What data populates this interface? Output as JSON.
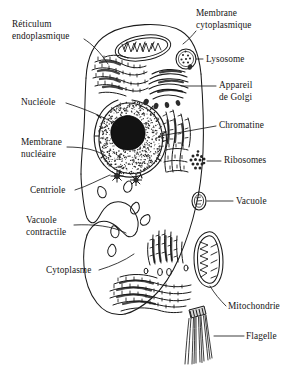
{
  "figure": {
    "language": "fr",
    "style": "black and white line drawing, hand-drawn biology textbook schematic",
    "background_color": "#ffffff",
    "ink_color": "#1a1a1a",
    "width": 301,
    "height": 377
  },
  "labels": {
    "reticulum_endoplasmique": "Réticulum\nendoplasmique",
    "reticulum_line1": "Réticulum",
    "reticulum_line2": "endoplasmique",
    "membrane_cytoplasmique_line1": "Membrane",
    "membrane_cytoplasmique_line2": "cytoplasmique",
    "lysosome": "Lysosome",
    "appareil_de_golgi_line1": "Appareil",
    "appareil_de_golgi_line2": "de Golgi",
    "nucleole": "Nucléole",
    "chromatine": "Chromatine",
    "membrane_nucleaire_line1": "Membrane",
    "membrane_nucleaire_line2": "nucléaire",
    "ribosomes": "Ribosomes",
    "centriole": "Centriole",
    "vacuole": "Vacuole",
    "vacuole_contractile_line1": "Vacuole",
    "vacuole_contractile_line2": "contractile",
    "cytoplasme": "Cytoplasme",
    "mitochondrie": "Mitochondrie",
    "flagelle": "Flagelle"
  },
  "structures": [
    {
      "name": "reticulum-endoplasmique",
      "label": "Réticulum endoplasmique",
      "side": "left",
      "label_xy": [
        12,
        24
      ]
    },
    {
      "name": "membrane-cytoplasmique",
      "label": "Membrane cytoplasmique",
      "side": "right",
      "label_xy": [
        196,
        10
      ]
    },
    {
      "name": "lysosome",
      "label": "Lysosome",
      "side": "right",
      "label_xy": [
        205,
        58
      ]
    },
    {
      "name": "appareil-de-golgi",
      "label": "Appareil de Golgi",
      "side": "right",
      "label_xy": [
        219,
        84
      ]
    },
    {
      "name": "nucleole",
      "label": "Nucléole",
      "side": "left",
      "label_xy": [
        22,
        98
      ]
    },
    {
      "name": "chromatine",
      "label": "Chromatine",
      "side": "right",
      "label_xy": [
        219,
        124
      ]
    },
    {
      "name": "membrane-nucleaire",
      "label": "Membrane nucléaire",
      "side": "left",
      "label_xy": [
        22,
        142
      ]
    },
    {
      "name": "ribosomes",
      "label": "Ribosomes",
      "side": "right",
      "label_xy": [
        224,
        156
      ]
    },
    {
      "name": "centriole",
      "label": "Centriole",
      "side": "left",
      "label_xy": [
        30,
        189
      ]
    },
    {
      "name": "vacuole",
      "label": "Vacuole",
      "side": "right",
      "label_xy": [
        236,
        200
      ]
    },
    {
      "name": "vacuole-contractile",
      "label": "Vacuole contractile",
      "side": "left",
      "label_xy": [
        26,
        220
      ]
    },
    {
      "name": "cytoplasme",
      "label": "Cytoplasme",
      "side": "left",
      "label_xy": [
        46,
        268
      ]
    },
    {
      "name": "mitochondrie",
      "label": "Mitochondrie",
      "side": "right",
      "label_xy": [
        228,
        304
      ]
    },
    {
      "name": "flagelle",
      "label": "Flagelle",
      "side": "right",
      "label_xy": [
        246,
        334
      ]
    }
  ]
}
